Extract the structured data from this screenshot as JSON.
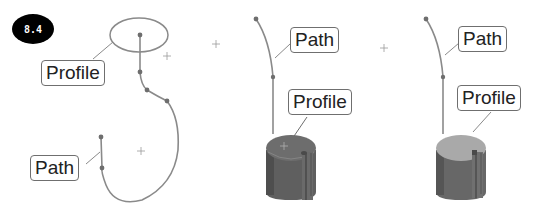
{
  "figure": {
    "badge": "8.4",
    "panels": [
      {
        "id": "panel-1-sketch",
        "labels": {
          "profile": "Profile",
          "path": "Path"
        }
      },
      {
        "id": "panel-2-sweep-preview",
        "labels": {
          "path": "Path",
          "profile": "Profile"
        }
      },
      {
        "id": "panel-3-sweep-result",
        "labels": {
          "path": "Path",
          "profile": "Profile"
        }
      }
    ]
  },
  "colors": {
    "curve": "#8a8a8a",
    "point": "#6e6e6e",
    "cylinder_top_dark": "#6b6b6b",
    "cylinder_side_dark": "#5a5a5a",
    "cylinder_top_light": "#a6a6a6",
    "cylinder_side_light": "#6a6a6a",
    "label_border": "#6f6f6f",
    "badge_bg": "#000000"
  }
}
